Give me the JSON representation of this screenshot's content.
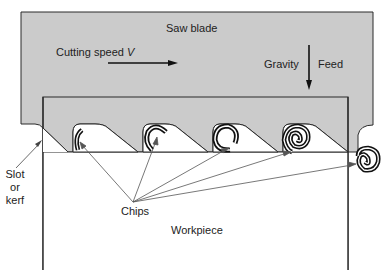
{
  "diagram": {
    "title": "Saw blade",
    "labels": {
      "cutting_speed": "Cutting speed",
      "cutting_speed_var": "V",
      "gravity": "Gravity",
      "feed": "Feed",
      "slot_line1": "Slot",
      "slot_line2": "or",
      "slot_line3": "kerf",
      "chips": "Chips",
      "workpiece": "Workpiece"
    },
    "colors": {
      "blade_fill": "#cbcbcb",
      "outline": "#2a2a2a",
      "background": "#ffffff"
    },
    "teeth_count": 4,
    "chip_count": 5
  }
}
